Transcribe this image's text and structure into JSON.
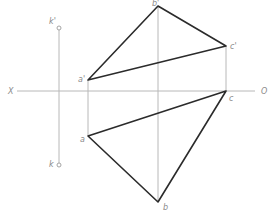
{
  "diagram": {
    "type": "orthographic-projection",
    "axis": {
      "left_label": "X",
      "right_label": "O",
      "y": 91,
      "x1": 17,
      "x2": 255
    },
    "colors": {
      "thin_line": "#b8b8b8",
      "thick_line": "#2b2b2b",
      "label": "#8a8a8a"
    },
    "point_k": {
      "upper_label": "k'",
      "lower_label": "k",
      "x": 59,
      "upper_y": 28,
      "lower_y": 165
    },
    "vertices": {
      "a_prime": {
        "label": "a'",
        "x": 88,
        "y": 80
      },
      "b_prime": {
        "label": "b'",
        "x": 158,
        "y": 6
      },
      "c_prime": {
        "label": "c'",
        "x": 226,
        "y": 46
      },
      "a": {
        "label": "a",
        "x": 88,
        "y": 136
      },
      "b": {
        "label": "b",
        "x": 158,
        "y": 202
      },
      "c": {
        "label": "c",
        "x": 226,
        "y": 91
      }
    },
    "triangles": [
      {
        "name": "frontal-view",
        "points": [
          "a'",
          "b'",
          "c'"
        ]
      },
      {
        "name": "top-view",
        "points": [
          "a",
          "b",
          "c"
        ]
      }
    ]
  }
}
